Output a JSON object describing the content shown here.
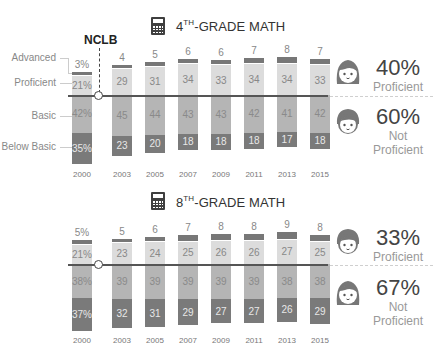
{
  "nclb": {
    "label": "NCLB"
  },
  "legend": {
    "advanced": "Advanced",
    "proficient": "Proficient",
    "basic": "Basic",
    "below_basic": "Below Basic"
  },
  "colors": {
    "advanced": "#777777",
    "proficient": "#dcdcdc",
    "basic": "#b5b5b5",
    "below_basic": "#7a7a7a",
    "baseline": "#555555"
  },
  "grade4": {
    "title_num": "4",
    "title_sup": "TH",
    "title_rest": "-GRADE MATH",
    "icon": "calculator-icon",
    "summary": {
      "proficient_pct": "40%",
      "proficient_label": "Proficient",
      "not_proficient_pct": "60%",
      "not_label": "Not",
      "not_proficient_label": "Proficient"
    },
    "years": [
      "2000",
      "2003",
      "2005",
      "2007",
      "2009",
      "2011",
      "2013",
      "2015"
    ],
    "labels": {
      "advanced": [
        "3%",
        "4",
        "5",
        "6",
        "6",
        "7",
        "8",
        "7"
      ],
      "proficient": [
        "21%",
        "29",
        "31",
        "34",
        "33",
        "34",
        "34",
        "33"
      ],
      "basic": [
        "42%",
        "45",
        "44",
        "43",
        "43",
        "42",
        "41",
        "42"
      ],
      "below_basic": [
        "35%",
        "23",
        "20",
        "18",
        "18",
        "18",
        "17",
        "18"
      ]
    }
  },
  "grade8": {
    "title_num": "8",
    "title_sup": "TH",
    "title_rest": "-GRADE MATH",
    "icon": "calculator-icon",
    "summary": {
      "proficient_pct": "33%",
      "proficient_label": "Proficient",
      "not_proficient_pct": "67%",
      "not_label": "Not",
      "not_proficient_label": "Proficient"
    },
    "years": [
      "2000",
      "2003",
      "2005",
      "2007",
      "2009",
      "2011",
      "2013",
      "2015"
    ],
    "labels": {
      "advanced": [
        "5%",
        "5",
        "6",
        "7",
        "8",
        "8",
        "9",
        "8"
      ],
      "proficient": [
        "21%",
        "23",
        "24",
        "25",
        "26",
        "26",
        "27",
        "25"
      ],
      "basic": [
        "38%",
        "39",
        "39",
        "39",
        "39",
        "39",
        "38",
        "38"
      ],
      "below_basic": [
        "37%",
        "32",
        "31",
        "29",
        "27",
        "27",
        "26",
        "29"
      ]
    }
  },
  "chart_data": [
    {
      "type": "bar",
      "title": "4TH-GRADE MATH",
      "stacked": true,
      "diverging_baseline": "Proficient / Not Proficient",
      "categories": [
        "2000",
        "2003",
        "2005",
        "2007",
        "2009",
        "2011",
        "2013",
        "2015"
      ],
      "series": [
        {
          "name": "Advanced",
          "values": [
            3,
            4,
            5,
            6,
            6,
            7,
            8,
            7
          ]
        },
        {
          "name": "Proficient",
          "values": [
            21,
            29,
            31,
            34,
            33,
            34,
            34,
            33
          ]
        },
        {
          "name": "Basic",
          "values": [
            42,
            45,
            44,
            43,
            43,
            42,
            41,
            42
          ]
        },
        {
          "name": "Below Basic",
          "values": [
            35,
            23,
            20,
            18,
            18,
            18,
            17,
            18
          ]
        }
      ],
      "annotations": [
        "NCLB (between 2000 and 2003)",
        "40% Proficient",
        "60% Not Proficient"
      ],
      "xlabel": "",
      "ylabel": "",
      "grid": false,
      "legend_position": "left"
    },
    {
      "type": "bar",
      "title": "8TH-GRADE MATH",
      "stacked": true,
      "diverging_baseline": "Proficient / Not Proficient",
      "categories": [
        "2000",
        "2003",
        "2005",
        "2007",
        "2009",
        "2011",
        "2013",
        "2015"
      ],
      "series": [
        {
          "name": "Advanced",
          "values": [
            5,
            5,
            6,
            7,
            8,
            8,
            9,
            8
          ]
        },
        {
          "name": "Proficient",
          "values": [
            21,
            23,
            24,
            25,
            26,
            26,
            27,
            25
          ]
        },
        {
          "name": "Basic",
          "values": [
            38,
            39,
            39,
            39,
            39,
            39,
            38,
            38
          ]
        },
        {
          "name": "Below Basic",
          "values": [
            37,
            32,
            31,
            29,
            27,
            27,
            26,
            29
          ]
        }
      ],
      "annotations": [
        "33% Proficient",
        "67% Not Proficient"
      ],
      "xlabel": "",
      "ylabel": "",
      "grid": false,
      "legend_position": "left"
    }
  ]
}
